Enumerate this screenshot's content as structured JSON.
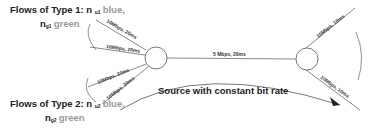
{
  "flows": {
    "type1": {
      "title": "Flows of Type 1: n",
      "sub1": "u1",
      "color1": "blue,",
      "var2": "n",
      "sub2": "g1",
      "color2": "green"
    },
    "type2": {
      "title": "Flows of Type 2: n",
      "sub1": "u2",
      "color1": "blue,",
      "var2": "n",
      "sub2": "g2",
      "color2": "green"
    }
  },
  "links": {
    "left1": "10Mbps, 20ms",
    "left2": "10Mbps, 20ms",
    "left3": "10Mbps, 20ms",
    "left4": "10Mbps, 20ms",
    "bottleneck": "5 Mbps, 20ms",
    "right_top": "10Mbps, 10ms",
    "right_bottom": "10Mbps, 10ms"
  },
  "source_label": "Source with constant bit rate",
  "colors": {
    "line": "#555555",
    "text": "#222222",
    "muted": "#999999"
  }
}
